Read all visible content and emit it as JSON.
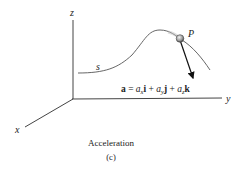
{
  "figure": {
    "axes": {
      "x_label": "x",
      "y_label": "y",
      "z_label": "z"
    },
    "curve_label": "s",
    "point_label": "P",
    "equation": {
      "a": "a",
      "eq": " = ",
      "ax": "a",
      "sub_x": "x",
      "i": "i",
      "plus1": " + ",
      "ay": "a",
      "sub_y": "y",
      "j": "j",
      "plus2": " + ",
      "az": "a",
      "sub_z": "z",
      "k": "k"
    },
    "caption": "Acceleration",
    "sublabel": "(c)"
  }
}
